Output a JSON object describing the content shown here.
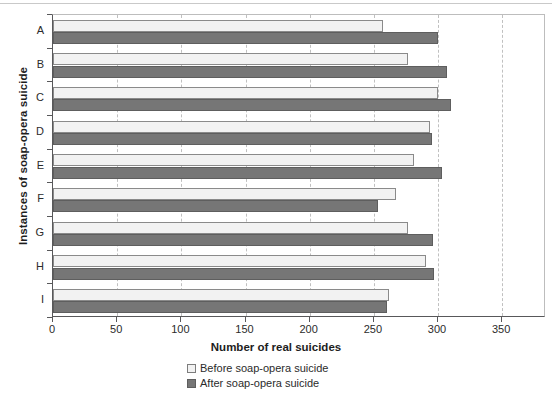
{
  "chart_data": {
    "type": "bar",
    "orientation": "horizontal",
    "title": "",
    "xlabel": "Number of real suicides",
    "ylabel": "Instances of soap-opera suicide",
    "categories": [
      "A",
      "B",
      "C",
      "D",
      "E",
      "F",
      "G",
      "H",
      "I"
    ],
    "xlim": [
      0,
      350
    ],
    "xticks": [
      0,
      50,
      100,
      150,
      200,
      250,
      300,
      350
    ],
    "xticklabels": [
      "0",
      "50",
      "100",
      "150",
      "200",
      "250",
      "300",
      "350"
    ],
    "grid": "vertical-dashed",
    "legend_position": "below-axes",
    "series": [
      {
        "name": "Before soap-opera suicide",
        "color": "#f2f2f2",
        "values": [
          257,
          277,
          300,
          294,
          281,
          267,
          277,
          291,
          262
        ]
      },
      {
        "name": "After soap-opera suicide",
        "color": "#767676",
        "values": [
          300,
          307,
          310,
          295,
          303,
          253,
          296,
          297,
          260
        ]
      }
    ]
  },
  "legend": {
    "items": [
      {
        "label": "Before soap-opera suicide",
        "swatch": "before"
      },
      {
        "label": "After soap-opera suicide",
        "swatch": "after"
      }
    ]
  }
}
